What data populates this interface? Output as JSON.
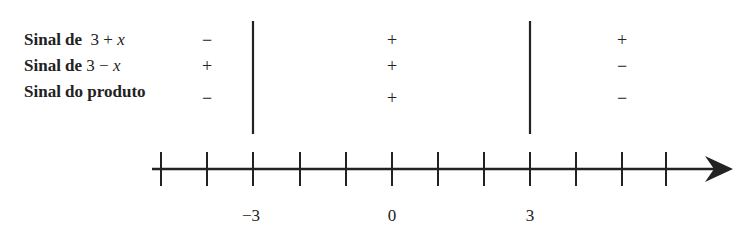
{
  "rows": [
    {
      "label_prefix": "Sinal de",
      "expr_a": "3 + ",
      "expr_var": "x",
      "signs": [
        "−",
        "+",
        "+"
      ]
    },
    {
      "label_prefix": "Sinal de",
      "expr_a": "3 − ",
      "expr_var": "x",
      "signs": [
        "+",
        "+",
        "−"
      ]
    },
    {
      "label_prefix": "Sinal do produto",
      "expr_a": "",
      "expr_var": "",
      "signs": [
        "−",
        "+",
        "−"
      ]
    }
  ],
  "axis": {
    "tick_labels": [
      "−3",
      "0",
      "3"
    ],
    "critical_points": [
      "−3",
      "3"
    ]
  },
  "colors": {
    "ink": "#222222",
    "background": "#ffffff"
  }
}
